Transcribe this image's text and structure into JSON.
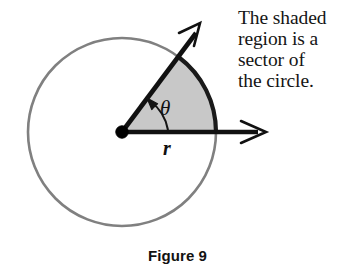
{
  "figure": {
    "caption": "Figure 9",
    "annotation": "The shaded\nregion is a\nsector of\nthe circle.",
    "annotation_lines": [
      "The shaded",
      "region is a",
      "sector of",
      "the circle."
    ],
    "labels": {
      "angle": "θ",
      "radius": "r"
    },
    "colors": {
      "circle_stroke": "#808080",
      "sector_fill": "#c8c8c8",
      "sector_arc_stroke": "#1a1a1a",
      "ray_stroke": "#111111",
      "center_dot": "#000000",
      "text": "#151515",
      "background": "#ffffff"
    },
    "geometry": {
      "center_x": 122,
      "center_y": 132,
      "radius": 94,
      "sector_start_angle_deg": 0,
      "sector_end_angle_deg": 53,
      "horizontal_ray_end_x": 265,
      "angled_ray_length": 134
    }
  }
}
